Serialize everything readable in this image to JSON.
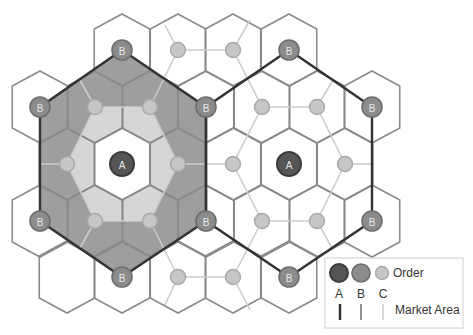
{
  "colors": {
    "background": "#ffffff",
    "hex_stroke": "#8a8a8a",
    "order_a": "#555555",
    "order_a_stroke": "#3a3a3a",
    "order_b": "#8c8c8c",
    "order_b_stroke": "#6e6e6e",
    "order_c": "#c6c6c6",
    "order_c_stroke": "#a8a8a8",
    "market_a": "#333333",
    "market_b": "#8a8a8a",
    "market_c": "#cccccc",
    "band_dark": "#9e9e9e",
    "band_light": "#d6d6d6"
  },
  "legend": {
    "order_label": "Order",
    "market_area_label": "Market Area",
    "levels": [
      "A",
      "B",
      "C"
    ]
  },
  "labels": {
    "a": "A",
    "b": "B"
  }
}
